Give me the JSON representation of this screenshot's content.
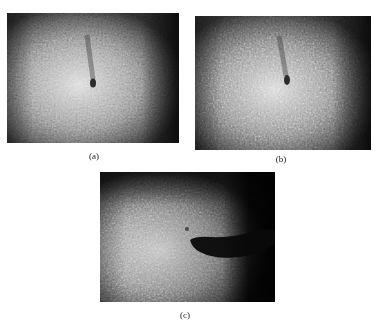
{
  "figure": {
    "panels": [
      {
        "id": "a",
        "label": "(a)",
        "box": {
          "x": 7,
          "y": 13,
          "w": 172,
          "h": 130
        },
        "description": "Speckle image, bright diffuse region left-center, small dark defect spot with short streak",
        "defect": {
          "cx": 86,
          "cy": 70,
          "type": "spot"
        }
      },
      {
        "id": "b",
        "label": "(b)",
        "box": {
          "x": 195,
          "y": 16,
          "w": 176,
          "h": 134
        },
        "description": "Speckle image nearly identical to (a), small dark defect spot with streak",
        "defect": {
          "cx": 92,
          "cy": 64,
          "type": "spot"
        }
      },
      {
        "id": "c",
        "label": "(c)",
        "box": {
          "x": 100,
          "y": 172,
          "w": 175,
          "h": 130
        },
        "description": "Speckle image with large dark crescent-shaped shadow extending to the right edge",
        "defect": {
          "cx": 120,
          "cy": 72,
          "type": "crescent"
        }
      }
    ]
  }
}
